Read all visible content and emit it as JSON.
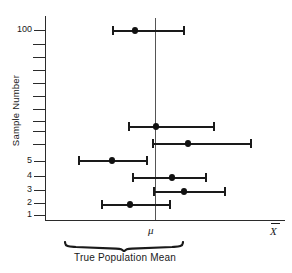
{
  "figure": {
    "title": "",
    "y_axis_title": "Sample Number",
    "x_axis_symbol": "X",
    "mu_symbol": "μ",
    "caption": "True Population Mean"
  },
  "chart_data": {
    "type": "scatter",
    "title": "",
    "subtitle": "",
    "xlabel": "X̅",
    "ylabel": "Sample Number",
    "grid": false,
    "legend": null,
    "annotations": [
      {
        "text": "μ",
        "role": "population-mean-marker",
        "x": "mu"
      },
      {
        "text": "True Population Mean",
        "role": "brace-caption"
      }
    ],
    "reference_line": {
      "orientation": "vertical",
      "label": "μ",
      "value": 0
    },
    "x": [
      -0.34,
      -0.06,
      0.3,
      -0.9,
      0.18,
      0.42,
      -0.28
    ],
    "y_tick_labels": [
      "1",
      "2",
      "3",
      "4",
      "5",
      "",
      "",
      "",
      "",
      "",
      "",
      "",
      "",
      "100"
    ],
    "series": [
      {
        "name": "sample confidence intervals",
        "points": [
          {
            "sample": "100",
            "estimate": -0.34,
            "lower": -0.76,
            "upper": 0.1,
            "contains_mu": true
          },
          {
            "sample": "",
            "estimate": -0.06,
            "lower": -0.54,
            "upper": 0.46,
            "contains_mu": true
          },
          {
            "sample": "5",
            "estimate": 0.3,
            "lower": -0.04,
            "upper": 0.86,
            "contains_mu": true
          },
          {
            "sample": "4",
            "estimate": -0.9,
            "lower": -1.38,
            "upper": -0.12,
            "contains_mu": false
          },
          {
            "sample": "3",
            "estimate": 0.18,
            "lower": -0.28,
            "upper": 0.62,
            "contains_mu": true
          },
          {
            "sample": "2",
            "estimate": 0.42,
            "lower": -0.04,
            "upper": 0.96,
            "contains_mu": true
          },
          {
            "sample": "1",
            "estimate": -0.28,
            "lower": -0.8,
            "upper": 0.14,
            "contains_mu": true
          }
        ]
      }
    ],
    "colors": {
      "marker": "#111111",
      "line": "#1a1a1a",
      "axis": "#2b2b2b",
      "reference": "#555555"
    }
  },
  "y_ticks": [
    {
      "label": "100",
      "top": 26,
      "y": 30
    },
    {
      "label": "",
      "top": 40,
      "y": 44
    },
    {
      "label": "",
      "top": 53,
      "y": 57
    },
    {
      "label": "",
      "top": 66,
      "y": 70
    },
    {
      "label": "",
      "top": 79,
      "y": 83
    },
    {
      "label": "",
      "top": 92,
      "y": 96
    },
    {
      "label": "",
      "top": 105,
      "y": 109
    },
    {
      "label": "",
      "top": 117,
      "y": 121
    },
    {
      "label": "",
      "top": 127,
      "y": 131
    },
    {
      "label": "",
      "top": 140,
      "y": 144
    },
    {
      "label": "5",
      "top": 157,
      "y": 161
    },
    {
      "label": "4",
      "top": 172,
      "y": 176
    },
    {
      "label": "3",
      "top": 186,
      "y": 190
    },
    {
      "label": "2",
      "top": 199,
      "y": 203
    },
    {
      "label": "1",
      "top": 211,
      "y": 215
    }
  ],
  "error_bars": [
    {
      "sample": "100",
      "left": 112,
      "right": 185,
      "dot": 135,
      "top": 25
    },
    {
      "sample": "",
      "left": 128,
      "right": 215,
      "dot": 156,
      "top": 121
    },
    {
      "sample": "5",
      "left": 152,
      "right": 252,
      "dot": 188,
      "top": 138
    },
    {
      "sample": "4",
      "left": 78,
      "right": 148,
      "dot": 112,
      "top": 155
    },
    {
      "sample": "3",
      "left": 132,
      "right": 207,
      "dot": 172,
      "top": 172
    },
    {
      "sample": "2",
      "left": 153,
      "right": 226,
      "dot": 184,
      "top": 186
    },
    {
      "sample": "1",
      "left": 101,
      "right": 171,
      "dot": 130,
      "top": 199
    }
  ]
}
